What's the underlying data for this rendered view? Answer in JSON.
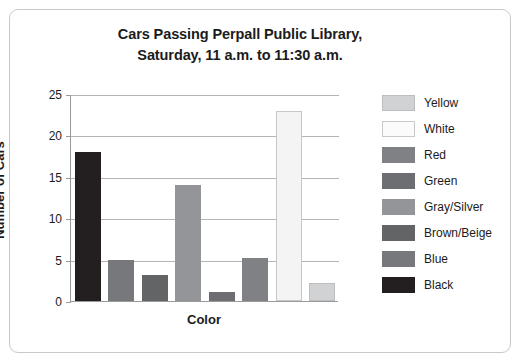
{
  "chart_data": {
    "type": "bar",
    "title": "Cars Passing Perpall Public Library, Saturday, 11 a.m. to 11:30 a.m.",
    "title_line1": "Cars Passing Perpall Public Library,",
    "title_line2": "Saturday, 11 a.m. to 11:30 a.m.",
    "xlabel": "Color",
    "ylabel": "Number of Cars",
    "ylim": [
      0,
      25
    ],
    "ytick_labels": [
      "0",
      "5",
      "10",
      "15",
      "20",
      "25"
    ],
    "ytick_values": [
      0,
      5,
      10,
      15,
      20,
      25
    ],
    "grid": "horizontal",
    "legend_position": "right",
    "categories": [
      "Black",
      "Blue",
      "Brown/Beige",
      "Gray/Silver",
      "Green",
      "Red",
      "White",
      "Yellow"
    ],
    "values": [
      18,
      5,
      3.2,
      14,
      1.1,
      5.2,
      23,
      2.2
    ],
    "bars": [
      {
        "category": "Black",
        "value": 18,
        "color": "#231f20",
        "border": "#231f20"
      },
      {
        "category": "Blue",
        "value": 5,
        "color": "#77787b",
        "border": "#77787b"
      },
      {
        "category": "Brown/Beige",
        "value": 3.2,
        "color": "#636466",
        "border": "#636466"
      },
      {
        "category": "Gray/Silver",
        "value": 14,
        "color": "#939598",
        "border": "#939598"
      },
      {
        "category": "Green",
        "value": 1.1,
        "color": "#6d6e71",
        "border": "#6d6e71"
      },
      {
        "category": "Red",
        "value": 5.2,
        "color": "#808184",
        "border": "#808184"
      },
      {
        "category": "White",
        "value": 23,
        "color": "#f4f4f4",
        "border": "#c7c8ca"
      },
      {
        "category": "Yellow",
        "value": 2.2,
        "color": "#d0d2d3",
        "border": "#bbbdbf"
      }
    ],
    "legend": [
      {
        "label": "Yellow",
        "color": "#d0d2d3",
        "border": "#bbbdbf"
      },
      {
        "label": "White",
        "color": "#fbfbfb",
        "border": "#c7c8ca"
      },
      {
        "label": "Red",
        "color": "#808184",
        "border": "#808184"
      },
      {
        "label": "Green",
        "color": "#6d6e71",
        "border": "#6d6e71"
      },
      {
        "label": "Gray/Silver",
        "color": "#939598",
        "border": "#939598"
      },
      {
        "label": "Brown/Beige",
        "color": "#636466",
        "border": "#636466"
      },
      {
        "label": "Blue",
        "color": "#77787b",
        "border": "#77787b"
      },
      {
        "label": "Black",
        "color": "#231f20",
        "border": "#231f20"
      }
    ]
  }
}
